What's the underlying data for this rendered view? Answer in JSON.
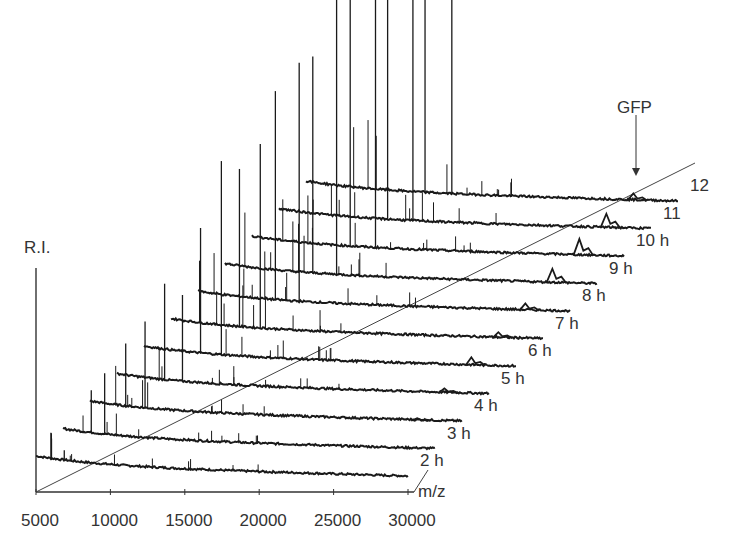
{
  "chart_data": {
    "type": "line",
    "subtype": "3d-waterfall-stacked-spectra",
    "title": "",
    "xlabel": "m/z",
    "ylabel": "R.I.",
    "xlim": [
      5000,
      30000
    ],
    "x_ticks": [
      "5000",
      "10000",
      "15000",
      "20000",
      "25000",
      "30000"
    ],
    "x_tick_values": [
      5000,
      10000,
      15000,
      20000,
      25000,
      30000
    ],
    "z_label": "time",
    "series_labels": [
      "2 h",
      "3 h",
      "4 h",
      "5 h",
      "6 h",
      "7 h",
      "8 h",
      "9 h",
      "10 h",
      "11",
      "12"
    ],
    "series": [
      {
        "name": "2 h",
        "peaks_mz": [
          6000,
          6900
        ],
        "peak_rel_heights": [
          0.3,
          0.12
        ],
        "gfp_peak": 0.0
      },
      {
        "name": "3 h",
        "peaks_mz": [
          6900,
          7800
        ],
        "peak_rel_heights": [
          0.35,
          0.5
        ],
        "gfp_peak": 0.0
      },
      {
        "name": "4 h",
        "peaks_mz": [
          7400,
          8700
        ],
        "peak_rel_heights": [
          0.4,
          0.55
        ],
        "gfp_peak": 0.02
      },
      {
        "name": "5 h",
        "peaks_mz": [
          8200,
          9400
        ],
        "peak_rel_heights": [
          0.5,
          0.45
        ],
        "gfp_peak": 0.04
      },
      {
        "name": "6 h",
        "peaks_mz": [
          8800,
          10200
        ],
        "peak_rel_heights": [
          0.55,
          0.85
        ],
        "gfp_peak": 0.07
      },
      {
        "name": "7 h",
        "peaks_mz": [
          9600,
          11000
        ],
        "peak_rel_heights": [
          0.6,
          0.7
        ],
        "gfp_peak": 0.05
      },
      {
        "name": "8 h",
        "peaks_mz": [
          10200,
          11800
        ],
        "peak_rel_heights": [
          0.7,
          0.8
        ],
        "gfp_peak": 0.06
      },
      {
        "name": "9 h",
        "peaks_mz": [
          10900,
          12500
        ],
        "peak_rel_heights": [
          0.65,
          0.9
        ],
        "gfp_peak": 0.12
      },
      {
        "name": "10 h",
        "peaks_mz": [
          11600,
          13300
        ],
        "peak_rel_heights": [
          0.75,
          1.0
        ],
        "gfp_peak": 0.14
      },
      {
        "name": "11",
        "peaks_mz": [
          12300,
          14000
        ],
        "peak_rel_heights": [
          0.7,
          0.85
        ],
        "gfp_peak": 0.12
      },
      {
        "name": "12",
        "peaks_mz": [
          13000,
          14800
        ],
        "peak_rel_heights": [
          0.55,
          0.6
        ],
        "gfp_peak": 0.06
      }
    ],
    "annotations": [
      {
        "text": "GFP",
        "target_series": "12",
        "arrow": true,
        "mz_approx": 27000
      }
    ],
    "grid": false,
    "legend": "none"
  },
  "labels": {
    "y_axis": "R.I.",
    "x_axis": "m/z",
    "annotation": "GFP"
  },
  "colors": {
    "trace": "#1a1a1a",
    "axis": "#333333",
    "background": "#ffffff"
  }
}
